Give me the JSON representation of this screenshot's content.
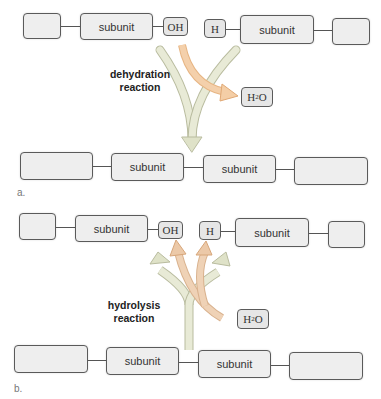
{
  "panel_a": {
    "letter": "a.",
    "reaction_label_line1": "dehydration",
    "reaction_label_line2": "reaction",
    "top_row": {
      "subunit_left": "subunit",
      "oh": "OH",
      "h": "H",
      "subunit_right": "subunit"
    },
    "water": {
      "h": "H",
      "sub": "2",
      "o": "O"
    },
    "bottom_row": {
      "subunit_left": "subunit",
      "subunit_right": "subunit"
    }
  },
  "panel_b": {
    "letter": "b.",
    "reaction_label_line1": "hydrolysis",
    "reaction_label_line2": "reaction",
    "top_row": {
      "subunit_left": "subunit",
      "oh": "OH",
      "h": "H",
      "subunit_right": "subunit"
    },
    "water": {
      "h": "H",
      "sub": "2",
      "o": "O"
    },
    "bottom_row": {
      "subunit_left": "subunit",
      "subunit_right": "subunit"
    }
  },
  "colors": {
    "arrow_light": "#e3e6cf",
    "arrow_orange": "#f2c79a",
    "box_fill": "#eeeeee",
    "border": "#5a5a5a"
  }
}
